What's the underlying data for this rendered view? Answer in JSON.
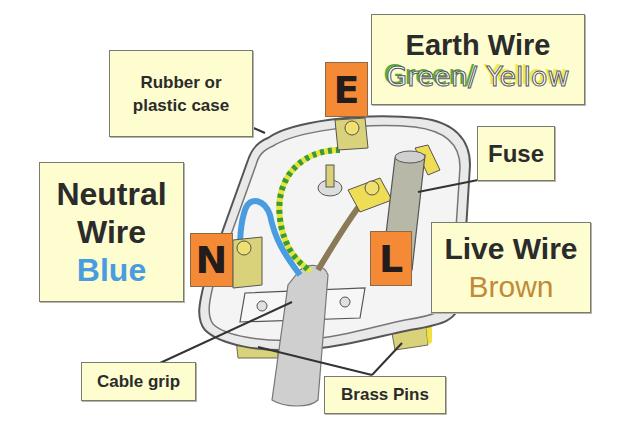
{
  "diagram": {
    "colors": {
      "label_bg": "#fdfdcf",
      "terminal_tile": "#f48a36",
      "neutral_wire": "#4a9ce0",
      "live_wire": "#8a7a55",
      "earth_green": "#3a9a3a",
      "earth_yellow": "#e6e63a",
      "brass": "#d9d27a"
    },
    "labels": {
      "case": {
        "line1": "Rubber or",
        "line2": "plastic case"
      },
      "earth": {
        "title": "Earth Wire",
        "color_green": "Green",
        "separator": "/",
        "color_yellow": "Yellow"
      },
      "fuse": {
        "text": "Fuse"
      },
      "neutral": {
        "line1": "Neutral",
        "line2": "Wire",
        "color": "Blue"
      },
      "live": {
        "title": "Live Wire",
        "color": "Brown"
      },
      "cable_grip": {
        "text": "Cable grip"
      },
      "brass_pins": {
        "text": "Brass Pins"
      }
    },
    "terminals": {
      "earth": "E",
      "neutral": "N",
      "live": "L"
    }
  }
}
